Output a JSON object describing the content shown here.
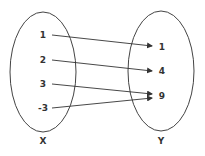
{
  "diagram": {
    "type": "function-mapping",
    "sets": [
      {
        "name": "X",
        "elements": [
          "1",
          "2",
          "3",
          "-3"
        ]
      },
      {
        "name": "Y",
        "elements": [
          "1",
          "4",
          "9"
        ]
      }
    ],
    "mappings": [
      {
        "from": "1",
        "to": "1"
      },
      {
        "from": "2",
        "to": "4"
      },
      {
        "from": "3",
        "to": "9"
      },
      {
        "from": "-3",
        "to": "9"
      }
    ],
    "colors": {
      "stroke": "#333333",
      "text": "#333333",
      "background": "#ffffff"
    }
  }
}
